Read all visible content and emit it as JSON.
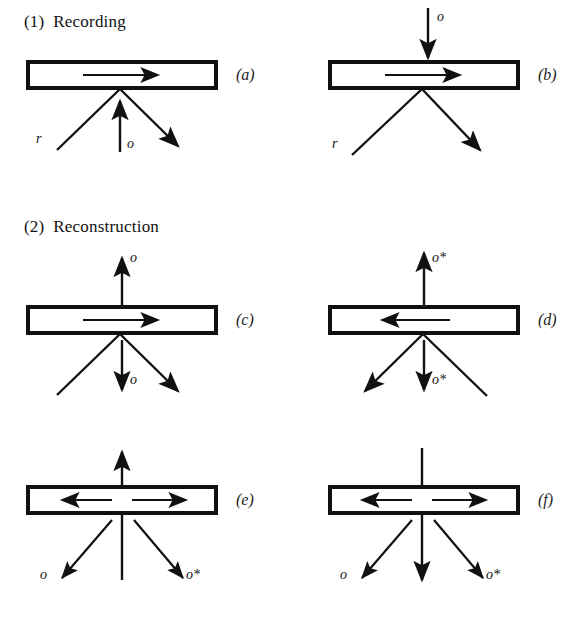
{
  "figure": {
    "background_color": "#ffffff",
    "ink_color": "#111111",
    "width": 586,
    "height": 634
  },
  "sections": [
    {
      "id": "recording",
      "number": "(1)",
      "title": "Recording",
      "label": "(1)  Recording"
    },
    {
      "id": "reconstruction",
      "number": "(2)",
      "title": "Reconstruction",
      "label": "(2)  Reconstruction"
    }
  ],
  "panels": [
    {
      "id": "a",
      "label": "(a)",
      "section": "recording",
      "plate_arrow_direction": "right",
      "top_beam": null,
      "bottom_labels": [
        "r",
        "o"
      ],
      "description": "reference beam r from lower left, object beam o from below, diffracted beam to lower right"
    },
    {
      "id": "b",
      "label": "(b)",
      "section": "recording",
      "plate_arrow_direction": "right",
      "top_beam": {
        "label": "o",
        "direction": "down"
      },
      "bottom_labels": [
        "r"
      ],
      "description": "object beam o incident from above, reference beam r from lower left"
    },
    {
      "id": "c",
      "label": "(c)",
      "section": "reconstruction",
      "plate_arrow_direction": "right",
      "top_beam": {
        "label": "o",
        "direction": "up"
      },
      "bottom_labels": [
        "o"
      ],
      "description": "reconstructed beam o upward and o downward"
    },
    {
      "id": "d",
      "label": "(d)",
      "section": "reconstruction",
      "plate_arrow_direction": "left",
      "top_beam": {
        "label": "o*",
        "direction": "up"
      },
      "bottom_labels": [
        "o*"
      ],
      "description": "phase conjugate beam o* upward and o* downward"
    },
    {
      "id": "e",
      "label": "(e)",
      "section": "reconstruction",
      "plate_arrow_direction": "both",
      "top_beam": {
        "label": "",
        "direction": "up"
      },
      "bottom_labels": [
        "o",
        "o*"
      ],
      "description": "counter-propagating arrows in plate, upward beam, o to lower left and o* to lower right"
    },
    {
      "id": "f",
      "label": "(f)",
      "section": "reconstruction",
      "plate_arrow_direction": "both",
      "top_beam": {
        "label": "",
        "direction": "down"
      },
      "bottom_labels": [
        "o",
        "o*"
      ],
      "description": "counter-propagating arrows in plate, downward beam through plate, o to lower left and o* to lower right"
    }
  ],
  "labels": {
    "reference_beam": "r",
    "object_beam": "o",
    "conjugate_beam": "o*",
    "panel_a": "(a)",
    "panel_b": "(b)",
    "panel_c": "(c)",
    "panel_d": "(d)",
    "panel_e": "(e)",
    "panel_f": "(f)"
  }
}
